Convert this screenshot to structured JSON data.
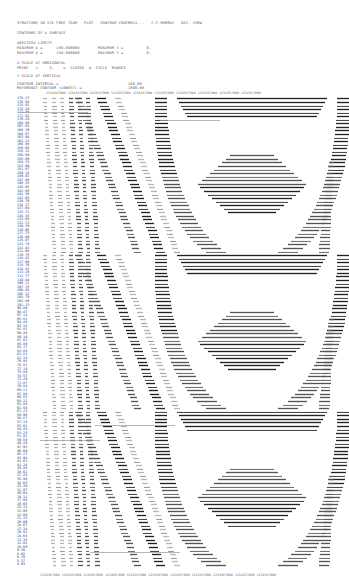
{
  "header": {
    "line1": "STRUCTURE IN ICE FREE TEAM - PLOT - CONTOUR CONTROLS...   C.F.MURRAY   DEC. 1964",
    "line2": "CONTOURS OF A SURFACE",
    "line3": "ABSCISSA LIMITS",
    "line4": "MINIMUM X =      100.000000        MINIMUM Y =          0.",
    "line5": "MAXIMUM X =      150.000000        MAXIMUM Y =          0.",
    "line6": "X-SCALE AT HORIZONTAL",
    "line7": "PRINT   1.    5.    =  CLOSED  4  CYCLE  RANGES",
    "line8": "Y-SCALE AT VERTICAL",
    "line9": "CONTOUR INTERVAL =                              100.00",
    "line10": "REFERENCE CONTOUR (LOWEST) =                   -1000.00"
  },
  "ruler": {
    "top": "1234567890 1234567890 1234567890 1234567890 1234567890 1234567890 1234567890 1234567890 1234567890 1234567890",
    "bottom": "1234567890 1234567890 1234567890 1234567890 1234567890 1234567890 1234567890 1234567890 1234567890 1234567890 1234567890"
  },
  "plot": {
    "row_count": 132,
    "label_start": 178.27,
    "label_step": -1.33,
    "symbols": [
      "...",
      "###",
      "CCCC",
      "EEEE",
      "$$$$",
      "****",
      "====",
      "++++"
    ]
  }
}
